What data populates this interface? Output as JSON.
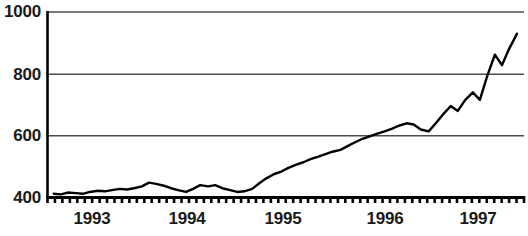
{
  "chart_data": {
    "type": "line",
    "title": "",
    "subtitle": "",
    "xlabel": "",
    "ylabel": "",
    "grid": true,
    "legend": null,
    "line_color": "#000000",
    "grid_color": "#666666",
    "axis_color": "#000000",
    "background": "#ffffff",
    "ylim": [
      400,
      1000
    ],
    "yticks": [
      400,
      600,
      800,
      1000
    ],
    "ytick_labels": [
      "400",
      "600",
      "800",
      "1000"
    ],
    "xlim": [
      1992.6,
      1998.0
    ],
    "xticks": [
      1993,
      1994,
      1995,
      1996,
      1997
    ],
    "xtick_labels": [
      "1993",
      "1994",
      "1995",
      "1996",
      "1997"
    ],
    "minor_tick_count": 64,
    "series": [
      {
        "name": "index",
        "x": [
          1992.67,
          1992.75,
          1992.83,
          1992.92,
          1993.0,
          1993.08,
          1993.17,
          1993.25,
          1993.33,
          1993.42,
          1993.5,
          1993.58,
          1993.67,
          1993.75,
          1993.83,
          1993.92,
          1994.0,
          1994.08,
          1994.17,
          1994.25,
          1994.33,
          1994.42,
          1994.5,
          1994.58,
          1994.67,
          1994.75,
          1994.83,
          1994.92,
          1995.0,
          1995.08,
          1995.17,
          1995.25,
          1995.33,
          1995.42,
          1995.5,
          1995.58,
          1995.67,
          1995.75,
          1995.83,
          1995.92,
          1996.0,
          1996.08,
          1996.17,
          1996.25,
          1996.33,
          1996.42,
          1996.5,
          1996.58,
          1996.67,
          1996.75,
          1996.83,
          1996.92,
          1997.0,
          1997.08,
          1997.17,
          1997.25,
          1997.33,
          1997.42,
          1997.5,
          1997.58,
          1997.67,
          1997.75,
          1997.83,
          1997.92
        ],
        "values": [
          412,
          410,
          416,
          414,
          412,
          418,
          422,
          420,
          424,
          428,
          426,
          430,
          436,
          448,
          444,
          438,
          430,
          424,
          418,
          428,
          440,
          436,
          440,
          430,
          424,
          418,
          420,
          428,
          446,
          462,
          476,
          484,
          496,
          506,
          514,
          524,
          532,
          540,
          548,
          554,
          566,
          578,
          590,
          598,
          606,
          614,
          622,
          632,
          640,
          636,
          620,
          614,
          640,
          668,
          696,
          680,
          714,
          740,
          716,
          790,
          862,
          828,
          880,
          930
        ]
      }
    ]
  }
}
